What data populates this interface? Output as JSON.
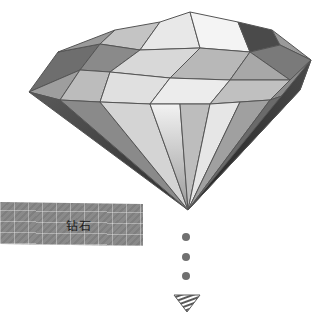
{
  "illustration": {
    "subject": "diamond",
    "style": "grayscale pencil sketch"
  },
  "label": {
    "text": "钻石"
  },
  "indicator": {
    "dots": 3,
    "arrow_direction": "down"
  },
  "colors": {
    "background": "#ffffff",
    "label_bar": "#8a8a8a",
    "label_text": "#1c1c1c",
    "dot": "#707070",
    "diamond_dark": "#3a3a3a",
    "diamond_mid": "#8c8c8c",
    "diamond_light": "#e6e6e6"
  }
}
